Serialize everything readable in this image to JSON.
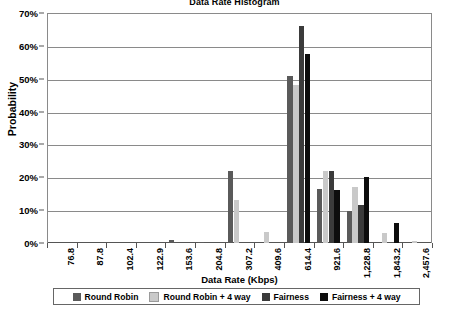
{
  "chart_data": {
    "type": "bar",
    "title": "Data Rate Histogram",
    "xlabel": "Data Rate (Kbps)",
    "ylabel": "Probability",
    "ylim": [
      0,
      70
    ],
    "ytick_labels": [
      "0%",
      "10%",
      "20%",
      "30%",
      "40%",
      "50%",
      "60%",
      "70%"
    ],
    "ytick_values": [
      0,
      10,
      20,
      30,
      40,
      50,
      60,
      70
    ],
    "grid": true,
    "legend_position": "bottom",
    "categories": [
      "76.8",
      "87.8",
      "102.4",
      "122.9",
      "153.6",
      "204.8",
      "307.2",
      "409.6",
      "614.4",
      "921.6",
      "1,228.8",
      "1,843.2",
      "2,457.6"
    ],
    "series": [
      {
        "name": "Round Robin",
        "color": "#5a5a5a",
        "values": [
          0,
          0,
          0,
          0,
          1.0,
          0.4,
          22.0,
          0,
          50.7,
          16.5,
          9.8,
          0,
          0
        ]
      },
      {
        "name": "Round Robin + 4 way",
        "color": "#c9c9c9",
        "values": [
          0,
          0,
          0,
          0,
          0,
          0,
          13.0,
          3.4,
          48.0,
          21.8,
          17.0,
          3.0,
          0.5
        ]
      },
      {
        "name": "Fairness",
        "color": "#3b3b3b",
        "values": [
          0,
          0,
          0,
          0,
          0,
          0,
          0,
          0,
          66.0,
          21.8,
          11.7,
          0,
          0
        ]
      },
      {
        "name": "Fairness + 4 way",
        "color": "#0d0d0d",
        "values": [
          0,
          0,
          0,
          0,
          0,
          0,
          0,
          0,
          57.5,
          16.2,
          20.2,
          6.0,
          0
        ]
      }
    ]
  }
}
